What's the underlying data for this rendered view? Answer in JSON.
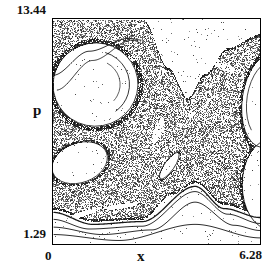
{
  "figure": {
    "background": "#ffffff",
    "ink": "#111111",
    "frame_color": "#000000"
  },
  "labels": {
    "y_max": "13.44",
    "y_axis": "p",
    "y_min": "1.29",
    "x_min": "0",
    "x_axis": "x",
    "x_max": "6.28"
  },
  "chart_data": {
    "type": "scatter",
    "title": "",
    "xlabel": "x",
    "ylabel": "p",
    "xlim": [
      0,
      6.28
    ],
    "ylim": [
      1.29,
      13.44
    ],
    "x_tick_labels": [
      "0",
      "6.28"
    ],
    "y_tick_labels": [
      "1.29",
      "13.44"
    ],
    "grid": false,
    "legend": "none",
    "frame": "box",
    "point_style": {
      "marker": "pixel-dot",
      "gray_range": [
        "#1e1e1e",
        "#9a9a9a"
      ],
      "sea_fill_density": 0.44,
      "edge_density": 0.8
    },
    "structure": {
      "chaotic_sea_top_boundary": [
        [
          0,
          13.44
        ],
        [
          2.6,
          13.44
        ],
        [
          2.72,
          13.44
        ],
        [
          3.5,
          10.8
        ],
        [
          4.07,
          9.21
        ],
        [
          4.6,
          10.5
        ],
        [
          5.3,
          11.9
        ],
        [
          6.28,
          12.64
        ]
      ],
      "chaotic_sea_bottom_boundary": [
        [
          0,
          3.16
        ],
        [
          1.2,
          2.52
        ],
        [
          2.69,
          2.63
        ],
        [
          3.59,
          3.97
        ],
        [
          4.31,
          4.61
        ],
        [
          5.17,
          3.43
        ],
        [
          6.28,
          2.9
        ]
      ],
      "hyperbolic_point": [
        4.1,
        7.0
      ],
      "islands": [
        {
          "name": "left-island",
          "center": [
            1.29,
            9.9
          ],
          "rx": 1.29,
          "ry": 2.25,
          "rot": -10
        },
        {
          "name": "left-lower-island",
          "center": [
            0.81,
            5.68
          ],
          "rx": 0.87,
          "ry": 1.07,
          "rot": -20
        },
        {
          "name": "right-island",
          "center": [
            6.52,
            9.05
          ],
          "rx": 0.78,
          "ry": 2.57,
          "rot": 8
        },
        {
          "name": "right-lower-island",
          "center": [
            6.58,
            4.5
          ],
          "rx": 0.84,
          "ry": 2.41,
          "rot": 0
        },
        {
          "name": "center-lens",
          "center": [
            3.53,
            5.52
          ],
          "rx": 0.48,
          "ry": 0.27,
          "rot": -55
        }
      ],
      "white_streaks": [
        {
          "center": [
            0.9,
            2.95
          ],
          "rx": 0.6,
          "ry": 0.14,
          "rot": -18
        },
        {
          "center": [
            2.05,
            3.35
          ],
          "rx": 0.5,
          "ry": 0.13,
          "rot": -8
        }
      ],
      "faint_streaks": [
        {
          "center": [
            3.17,
            7.45
          ],
          "rx": 0.42,
          "ry": 0.21,
          "rot": -70
        },
        {
          "center": [
            2.03,
            11.19
          ],
          "rx": 0.54,
          "ry": 0.21,
          "rot": -10
        },
        {
          "center": [
            5.17,
            10.92
          ],
          "rx": 0.45,
          "ry": 0.2,
          "rot": 25
        }
      ],
      "kam_curves": [
        [
          [
            0,
            3.0
          ],
          [
            1.2,
            2.35
          ],
          [
            2.7,
            2.5
          ],
          [
            4.31,
            4.4
          ],
          [
            5.2,
            3.2
          ],
          [
            6.28,
            2.72
          ]
        ],
        [
          [
            0,
            2.62
          ],
          [
            1.1,
            2.1
          ],
          [
            2.7,
            2.25
          ],
          [
            4.31,
            4.12
          ],
          [
            5.3,
            2.9
          ],
          [
            6.28,
            2.4
          ]
        ],
        [
          [
            0,
            2.2
          ],
          [
            1.5,
            1.8
          ],
          [
            3.0,
            2.05
          ],
          [
            4.31,
            3.55
          ],
          [
            5.5,
            2.3
          ],
          [
            6.28,
            2.02
          ]
        ],
        [
          [
            0,
            1.8
          ],
          [
            2.0,
            1.48
          ],
          [
            4.31,
            2.35
          ],
          [
            6.28,
            1.62
          ]
        ]
      ],
      "upper_left_arcs": [
        [
          [
            0,
            10.4
          ],
          [
            1.1,
            11.7
          ],
          [
            2.3,
            12.4
          ],
          [
            2.7,
            12.3
          ]
        ],
        [
          [
            0.1,
            9.6
          ],
          [
            1.2,
            11.2
          ],
          [
            2.4,
            12.3
          ],
          [
            2.75,
            12.1
          ]
        ]
      ]
    }
  }
}
